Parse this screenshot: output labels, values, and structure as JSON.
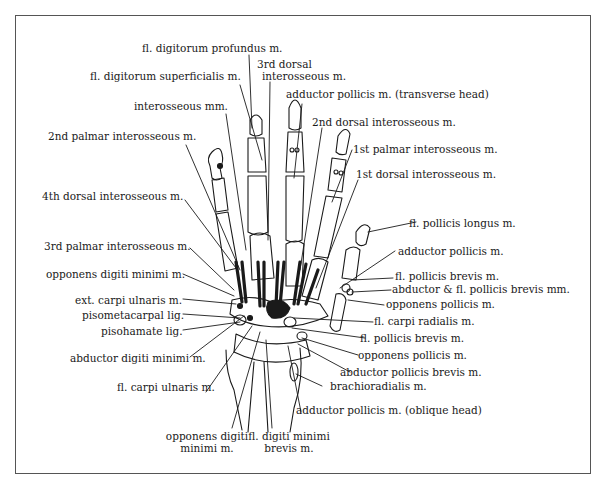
{
  "figure": {
    "type": "anatomical line drawing",
    "colors": {
      "ink": "#1a1a1a",
      "frame": "#555555",
      "background": "#ffffff"
    }
  },
  "labels": {
    "fl_digitorum_profundus": "fl. digitorum profundus m.",
    "third_dorsal_interosseous_l1": "3rd dorsal",
    "third_dorsal_interosseous_l2": "interosseous m.",
    "fl_digitorum_superficialis": "fl. digitorum superficialis m.",
    "adductor_pollicis_transverse": "adductor pollicis m. (transverse head)",
    "interosseous_mm": "interosseous mm.",
    "second_dorsal_interosseous": "2nd dorsal interosseous m.",
    "second_palmar_interosseous": "2nd palmar interosseous m.",
    "first_palmar_interosseous": "1st palmar interosseous m.",
    "first_dorsal_interosseous": "1st dorsal interosseous m.",
    "fourth_dorsal_interosseous": "4th dorsal interosseous m.",
    "fl_pollicis_longus": "fl. pollicis longus m.",
    "third_palmar_interosseous": "3rd palmar interosseous m.",
    "adductor_pollicis": "adductor pollicis m.",
    "opponens_digiti_minimi": "opponens digiti minimi m.",
    "fl_pollicis_brevis_1": "fl. pollicis brevis m.",
    "abductor_fl_pollicis_brevis": "abductor & fl. pollicis brevis mm.",
    "ext_carpi_ulnaris": "ext. carpi ulnaris m.",
    "opponens_pollicis_1": "opponens pollicis m.",
    "pisometacarpal_lig": "pisometacarpal lig.",
    "fl_carpi_radialis": "fl. carpi radialis m.",
    "pisohamate_lig": "pisohamate lig.",
    "fl_pollicis_brevis_2": "fl. pollicis brevis m.",
    "opponens_pollicis_2": "opponens pollicis m.",
    "abductor_digiti_minimi": "abductor digiti minimi m.",
    "abductor_pollicis_brevis": "abductor pollicis brevis m.",
    "brachioradialis": "brachioradialis m.",
    "fl_carpi_ulnaris": "fl. carpi ulnaris m.",
    "adductor_pollicis_oblique": "adductor pollicis m. (oblique head)",
    "opponens_digiti_minimi_bottom_l1": "opponens digiti",
    "opponens_digiti_minimi_bottom_l2": "minimi m.",
    "fl_digiti_minimi_brevis_l1": "fl. digiti minimi",
    "fl_digiti_minimi_brevis_l2": "brevis m."
  }
}
